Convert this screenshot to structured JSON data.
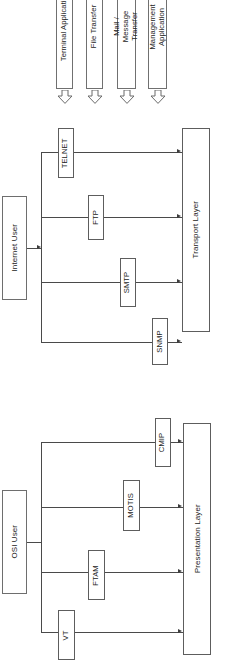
{
  "diagram": {
    "orientation": "rotated-90-ccw",
    "colors": {
      "box_stroke": "#6e6e6e",
      "line": "#4a4a4a",
      "text": "#1c1c1c",
      "background": "#ffffff"
    }
  },
  "applications": [
    {
      "id": "terminal-application",
      "label": "Terminal Application"
    },
    {
      "id": "file-transfer",
      "label": "File Transfer"
    },
    {
      "id": "mail-message-transfer",
      "label": "Mail / Message Transfer"
    },
    {
      "id": "management-application",
      "label": "Management Application"
    }
  ],
  "arrows": [
    {
      "id": "arrow-terminal",
      "icon": "block-arrow-icon"
    },
    {
      "id": "arrow-file-transfer",
      "icon": "block-arrow-icon"
    },
    {
      "id": "arrow-mail",
      "icon": "block-arrow-icon"
    },
    {
      "id": "arrow-management",
      "icon": "block-arrow-icon"
    }
  ],
  "internet": {
    "user": {
      "id": "internet-user",
      "label": "Internet User"
    },
    "protocols": [
      {
        "id": "telnet",
        "label": "TELNET"
      },
      {
        "id": "ftp",
        "label": "FTP"
      },
      {
        "id": "smtp",
        "label": "SMTP"
      },
      {
        "id": "snmp",
        "label": "SNMP"
      }
    ],
    "layer": {
      "id": "transport-layer",
      "label": "Transport Layer"
    }
  },
  "osi": {
    "user": {
      "id": "osi-user",
      "label": "OSI User"
    },
    "protocols": [
      {
        "id": "cmip",
        "label": "CMIP"
      },
      {
        "id": "motis",
        "label": "MOTIS"
      },
      {
        "id": "ftam",
        "label": "FTAM"
      },
      {
        "id": "vt",
        "label": "VT"
      }
    ],
    "layer": {
      "id": "presentation-layer",
      "label": "Presentation Layer"
    }
  }
}
